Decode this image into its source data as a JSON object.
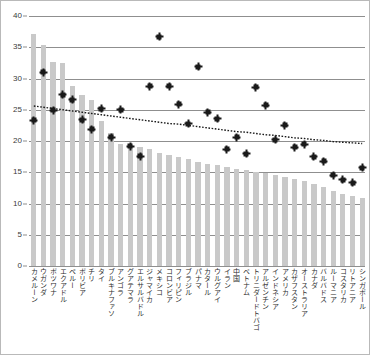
{
  "chart_data": {
    "type": "bar",
    "title": "",
    "subtitle": "",
    "xlabel": "",
    "ylabel": "",
    "ylim": [
      0,
      40
    ],
    "yticks": [
      0,
      5,
      10,
      15,
      20,
      25,
      30,
      35,
      40
    ],
    "grid": true,
    "legend": false,
    "legend_position": "none",
    "categories": [
      "カメルーン",
      "ウガンダ",
      "ボツワナ",
      "エクアドル",
      "ペルー",
      "ボリビア",
      "チリ",
      "タイ",
      "ブルキナファソ",
      "アンゴラ",
      "グアテマラ",
      "エルサルバドル",
      "ジャマイカ",
      "メキシコ",
      "コロンビア",
      "フィリピン",
      "ブラジル",
      "パナマ",
      "カタール",
      "ウルグアイ",
      "イラン",
      "中国",
      "ベトナム",
      "トリニダードトバゴ",
      "アルゼンチン",
      "インドネシア",
      "アメリカ",
      "カザフスタン",
      "オーストラリア",
      "カナダ",
      "バルバドス",
      "ルーマニア",
      "コスタリカ",
      "リトアニア",
      "シンガポール"
    ],
    "series": [
      {
        "name": "bars",
        "type": "bar",
        "color": "#c9c9c9",
        "values": [
          37.2,
          35.3,
          32.7,
          32.5,
          28.8,
          27.3,
          26.6,
          23.2,
          21.3,
          19.6,
          19.3,
          19.1,
          18.7,
          18.1,
          17.7,
          17.4,
          17.2,
          16.7,
          16.4,
          16.1,
          15.9,
          15.6,
          15.3,
          15.1,
          14.9,
          14.6,
          14.3,
          14.0,
          13.6,
          13.2,
          12.6,
          12.0,
          11.6,
          11.2,
          10.9
        ]
      },
      {
        "name": "points",
        "type": "scatter",
        "color": "#1a1a1a",
        "values": [
          23.7,
          31.4,
          25.3,
          27.8,
          27.0,
          23.8,
          22.3,
          25.6,
          21.0,
          25.4,
          19.6,
          18.0,
          29.2,
          37.1,
          29.2,
          26.3,
          23.2,
          32.3,
          25.0,
          24.0,
          19.1,
          21.0,
          18.4,
          29.0,
          26.1,
          20.6,
          22.9,
          19.4,
          19.9,
          17.9,
          17.2,
          14.9,
          14.2,
          13.7,
          16.1
        ]
      },
      {
        "name": "trend",
        "type": "line",
        "style": "dotted",
        "color": "#1a1a1a",
        "values": [
          25.6,
          25.4,
          25.2,
          25.0,
          24.8,
          24.6,
          24.4,
          24.2,
          24.0,
          23.8,
          23.6,
          23.4,
          23.2,
          23.0,
          22.8,
          22.7,
          22.5,
          22.3,
          22.1,
          21.9,
          21.7,
          21.5,
          21.4,
          21.2,
          21.0,
          20.9,
          20.7,
          20.5,
          20.4,
          20.2,
          20.1,
          19.9,
          19.8,
          19.7,
          19.6
        ]
      }
    ]
  },
  "style": {
    "bar_color": "#c9c9c9",
    "point_color": "#1a1a1a",
    "grid_color": "#8f8f8f",
    "border_color": "#b9b9b9",
    "tick_text_color": "#3a3a3a",
    "label_text_color": "#2c2c2c"
  }
}
